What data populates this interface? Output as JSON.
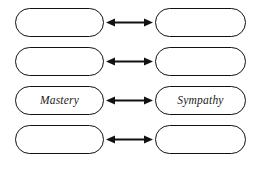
{
  "diagram": {
    "type": "paired-concept-map",
    "background_color": "#ffffff",
    "stroke_color": "#111111",
    "rows": [
      {
        "index": 1,
        "left": {
          "label": "",
          "empty": true
        },
        "connector": {
          "icon": "double-headed-arrow",
          "label": ""
        },
        "right": {
          "label": "",
          "empty": true
        }
      },
      {
        "index": 2,
        "left": {
          "label": "",
          "empty": true
        },
        "connector": {
          "icon": "double-headed-arrow",
          "label": ""
        },
        "right": {
          "label": "",
          "empty": true
        }
      },
      {
        "index": 3,
        "left": {
          "label": "Mastery",
          "empty": false
        },
        "connector": {
          "icon": "double-headed-arrow",
          "label": ""
        },
        "right": {
          "label": "Sympathy",
          "empty": false
        }
      },
      {
        "index": 4,
        "left": {
          "label": "",
          "empty": true
        },
        "connector": {
          "icon": "double-headed-arrow",
          "label": ""
        },
        "right": {
          "label": "",
          "empty": true
        }
      }
    ]
  }
}
